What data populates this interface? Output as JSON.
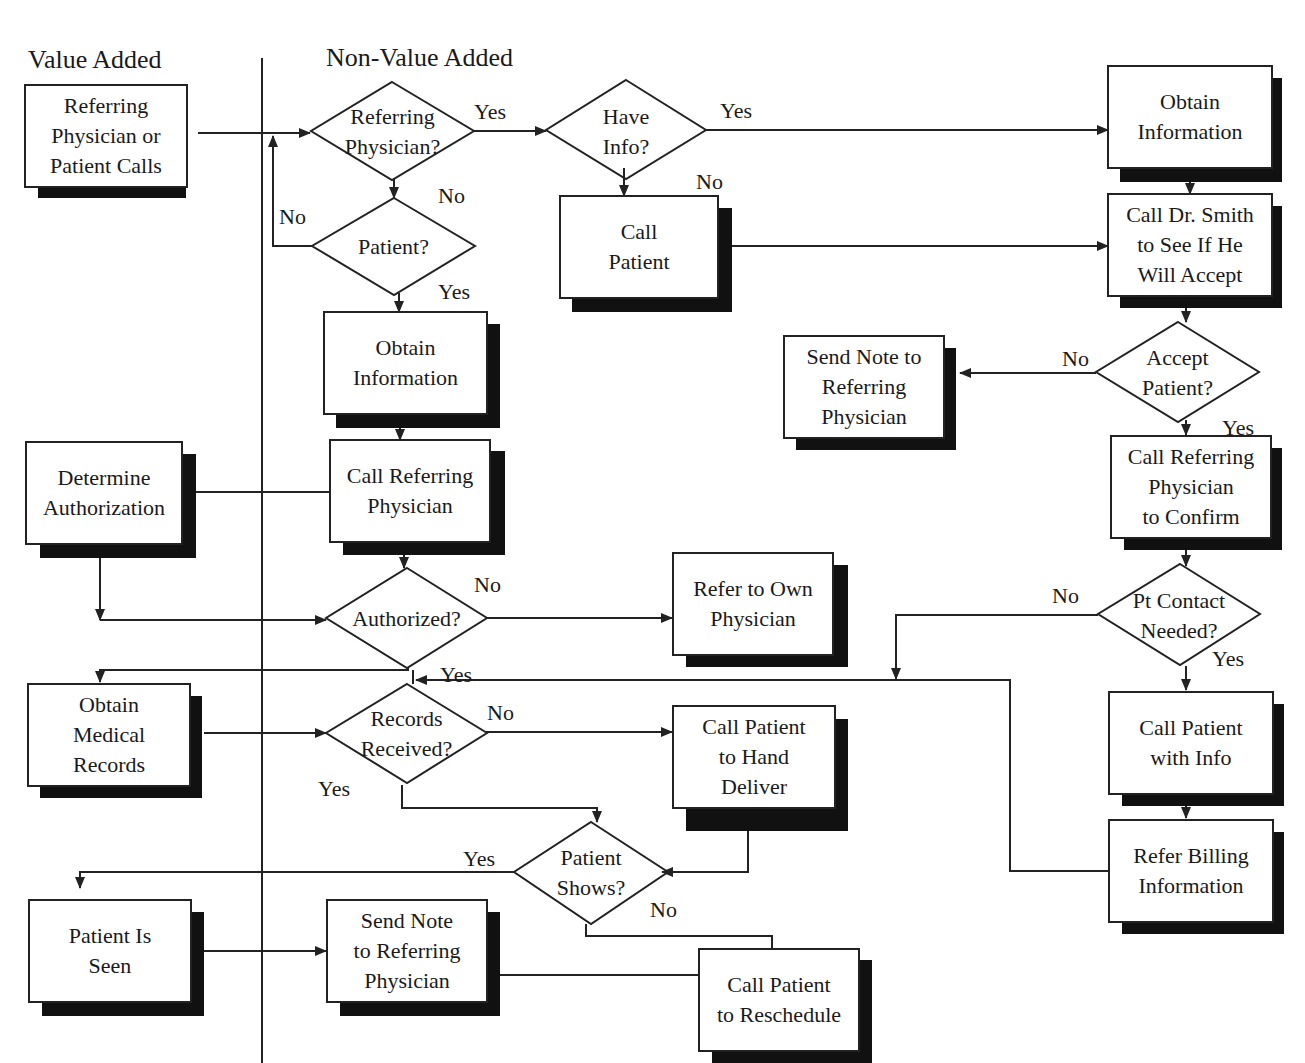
{
  "lanes": {
    "value_added": "Value Added",
    "non_value_added": "Non-Value Added"
  },
  "processes": {
    "referring_calls": "Referring\nPhysician or\nPatient Calls",
    "obtain_info_center": "Obtain\nInformation",
    "call_referring_center": "Call Referring\nPhysician",
    "determine_authorization": "Determine\nAuthorization",
    "call_patient_top": "Call\nPatient",
    "obtain_info_right": "Obtain\nInformation",
    "call_dr_smith": "Call Dr. Smith\nto See If He\nWill Accept",
    "send_note_right": "Send Note to\nReferring\nPhysician",
    "call_referring_confirm": "Call Referring\nPhysician\nto Confirm",
    "refer_own_physician": "Refer to Own\nPhysician",
    "obtain_medical_records": "Obtain\nMedical\nRecords",
    "call_patient_hand_deliver": "Call Patient\nto Hand\nDeliver",
    "call_patient_with_info": "Call Patient\nwith Info",
    "refer_billing": "Refer Billing\nInformation",
    "patient_is_seen": "Patient Is\nSeen",
    "send_note_bottom": "Send Note\nto Referring\nPhysician",
    "call_patient_reschedule": "Call Patient\nto Reschedule"
  },
  "decisions": {
    "referring_physician": "Referring\nPhysician?",
    "patient": "Patient?",
    "have_info": "Have\nInfo?",
    "accept_patient": "Accept\nPatient?",
    "authorized": "Authorized?",
    "records_received": "Records\nReceived?",
    "pt_contact_needed": "Pt Contact\nNeeded?",
    "patient_shows": "Patient\nShows?"
  },
  "edge_labels": {
    "refphys_yes": "Yes",
    "refphys_no": "No",
    "patient_no": "No",
    "patient_yes": "Yes",
    "haveinfo_yes": "Yes",
    "haveinfo_no": "No",
    "accept_no": "No",
    "accept_yes": "Yes",
    "authorized_no": "No",
    "authorized_yes": "Yes",
    "records_no": "No",
    "records_yes": "Yes",
    "ptcontact_no": "No",
    "ptcontact_yes": "Yes",
    "shows_yes": "Yes",
    "shows_no": "No"
  }
}
